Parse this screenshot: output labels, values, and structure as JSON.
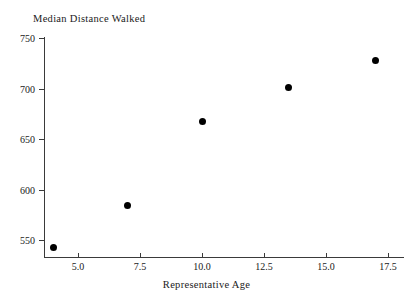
{
  "chart_data": {
    "type": "scatter",
    "title": "Median Distance Walked",
    "xlabel": "Representative Age",
    "ylabel": "",
    "x": [
      4.0,
      7.0,
      10.0,
      13.5,
      17.0
    ],
    "values": [
      543,
      584,
      667,
      701,
      728
    ],
    "series": [
      {
        "name": "Median Distance Walked",
        "points": [
          {
            "x": 4.0,
            "y": 543
          },
          {
            "x": 7.0,
            "y": 584
          },
          {
            "x": 10.0,
            "y": 667
          },
          {
            "x": 13.5,
            "y": 701
          },
          {
            "x": 17.0,
            "y": 728
          }
        ]
      }
    ],
    "xlim": [
      3.14,
      17.65
    ],
    "ylim": [
      533,
      753
    ],
    "xticks": [
      5.0,
      7.5,
      10.0,
      12.5,
      15.0,
      17.5
    ],
    "xtick_labels": [
      "5.0",
      "7.5",
      "10.0",
      "12.5",
      "15.0",
      "17.5"
    ],
    "yticks": [
      550,
      600,
      650,
      700,
      750
    ],
    "ytick_labels": [
      "550",
      "600",
      "650",
      "700",
      "750"
    ],
    "grid": false,
    "legend": null,
    "marker": "filled-circle",
    "marker_color": "#000000",
    "axis_color": "#3a3a3a",
    "background_color": "#ffffff"
  }
}
